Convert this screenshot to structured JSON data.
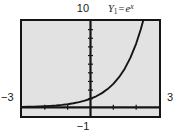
{
  "figure": {
    "function_label": {
      "name": "Y",
      "subscript": "1",
      "equals": "=",
      "base": "e",
      "exponent": "x"
    },
    "axis_labels": {
      "y_max": "10",
      "y_min": "−1",
      "x_min": "−3",
      "x_max": "3"
    },
    "colors": {
      "background": "#e2e2e2",
      "frame": "#151515",
      "axis": "#151515",
      "curve": "#151515",
      "page": "#ffffff"
    }
  },
  "chart_data": {
    "type": "line",
    "title": "",
    "subtitle": "",
    "xlabel": "",
    "ylabel": "",
    "annotations": [
      "Y1 = e^x"
    ],
    "legend": [
      "Y1 = e^x"
    ],
    "legend_position": "top-right",
    "grid": false,
    "xlim": [
      -3,
      3
    ],
    "ylim": [
      -1,
      10
    ],
    "xticks": [
      -3,
      -2,
      -1,
      0,
      1,
      2,
      3
    ],
    "yticks": [
      -1,
      0,
      1,
      2,
      3,
      4,
      5,
      6,
      7,
      8,
      9,
      10
    ],
    "xtick_labels": [
      "-3",
      "",
      "",
      "",
      "",
      "",
      "3"
    ],
    "ytick_labels": [
      "-1",
      "",
      "",
      "",
      "",
      "",
      "",
      "",
      "",
      "",
      "",
      "10"
    ],
    "series": [
      {
        "name": "Y1 = e^x",
        "expression": "y = e^x",
        "x": [
          -3,
          -2.75,
          -2.5,
          -2.25,
          -2,
          -1.75,
          -1.5,
          -1.25,
          -1,
          -0.75,
          -0.5,
          -0.25,
          0,
          0.25,
          0.5,
          0.75,
          1,
          1.25,
          1.5,
          1.75,
          2,
          2.2,
          2.3
        ],
        "y": [
          0.0498,
          0.0639,
          0.0821,
          0.1054,
          0.1353,
          0.1738,
          0.2231,
          0.2865,
          0.3679,
          0.4724,
          0.6065,
          0.7788,
          1.0,
          1.284,
          1.6487,
          2.117,
          2.7183,
          3.4903,
          4.4817,
          5.7546,
          7.3891,
          9.025,
          9.974
        ]
      }
    ]
  }
}
